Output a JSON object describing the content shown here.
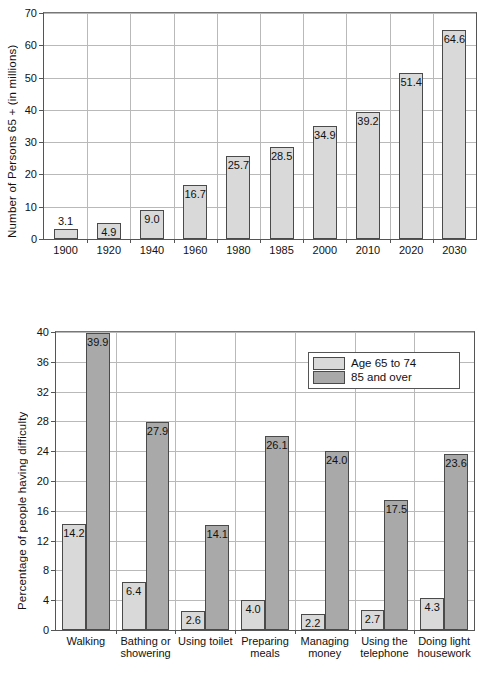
{
  "colors": {
    "light_bar": "#d9d9d9",
    "dark_bar": "#a9a9a9",
    "bar_border": "#4a4a4a",
    "grid": "#b9b9b9",
    "axis": "#555555",
    "background": "#ffffff"
  },
  "chart_data": [
    {
      "type": "bar",
      "title": "",
      "xlabel": "",
      "ylabel": "Number of Persons 65 + (in millions)",
      "ylim": [
        0,
        70
      ],
      "yticks": [
        0,
        10,
        20,
        30,
        40,
        50,
        60,
        70
      ],
      "grid": true,
      "legend": null,
      "categories": [
        "1900",
        "1920",
        "1940",
        "1960",
        "1980",
        "1985",
        "2000",
        "2010",
        "2020",
        "2030"
      ],
      "values": [
        3.1,
        4.9,
        9.0,
        16.7,
        25.7,
        28.5,
        34.9,
        39.2,
        51.4,
        64.6
      ],
      "value_labels": [
        "3.1",
        "4.9",
        "9.0",
        "16.7",
        "25.7",
        "28.5",
        "34.9",
        "39.2",
        "51.4",
        "64.6"
      ],
      "label_placement": [
        "above",
        "inside",
        "inside",
        "inside",
        "inside",
        "inside",
        "inside",
        "inside",
        "inside",
        "inside"
      ],
      "bar_color": "#d9d9d9"
    },
    {
      "type": "bar",
      "title": "",
      "xlabel": "",
      "ylabel": "Percentage of people having difficulty",
      "ylim": [
        0,
        40
      ],
      "yticks": [
        0,
        4,
        8,
        12,
        16,
        20,
        24,
        28,
        32,
        36,
        40
      ],
      "grid": true,
      "legend": {
        "position": "top-right",
        "entries": [
          {
            "label": "Age 65 to 74",
            "color": "#d9d9d9"
          },
          {
            "label": "85 and over",
            "color": "#a9a9a9"
          }
        ]
      },
      "categories": [
        "Walking",
        "Bathing or\nshowering",
        "Using toilet",
        "Preparing\nmeals",
        "Managing\nmoney",
        "Using the\ntelephone",
        "Doing light\nhousework"
      ],
      "series": [
        {
          "name": "Age 65 to 74",
          "color": "#d9d9d9",
          "values": [
            14.2,
            6.4,
            2.6,
            4.0,
            2.2,
            2.7,
            4.3
          ],
          "value_labels": [
            "14.2",
            "6.4",
            "2.6",
            "4.0",
            "2.2",
            "2.7",
            "4.3"
          ]
        },
        {
          "name": "85 and over",
          "color": "#a9a9a9",
          "values": [
            39.9,
            27.9,
            14.1,
            26.1,
            24.0,
            17.5,
            23.6
          ],
          "value_labels": [
            "39.9",
            "27.9",
            "14.1",
            "26.1",
            "24.0",
            "17.5",
            "23.6"
          ]
        }
      ]
    }
  ]
}
